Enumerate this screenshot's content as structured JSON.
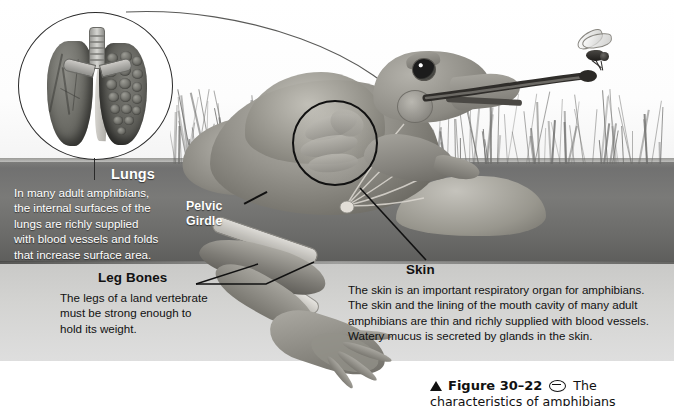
{
  "figure": {
    "background": {
      "sky_color": "#ffffff",
      "water_color": "#6f6f6f",
      "underwater_color": "#d3d3d1"
    }
  },
  "insets": {
    "lungs": {
      "label": "lungs-magnification-circle",
      "parts": [
        "trachea",
        "left-lung",
        "right-lung-cutaway",
        "alveoli"
      ]
    }
  },
  "callouts": [
    {
      "id": "lungs",
      "title": "Lungs",
      "body": "In many adult amphibians, the internal surfaces of the lungs are richly supplied with blood vessels and folds that increase surface area.",
      "lines": [
        "In many adult amphibians,",
        "the internal surfaces of the",
        "lungs are richly supplied",
        "with blood vessels and folds",
        "that increase surface area."
      ],
      "text_color": "#ffffff"
    },
    {
      "id": "pelvic-girdle",
      "title": "Pelvic Girdle",
      "lines": [
        "Pelvic",
        "Girdle"
      ],
      "body": "",
      "text_color": "#ffffff"
    },
    {
      "id": "leg-bones",
      "title": "Leg Bones",
      "body": "The legs of a land vertebrate must be strong enough to hold its weight.",
      "lines": [
        "The legs of a land vertebrate",
        "must be strong enough to",
        "hold its weight."
      ],
      "text_color": "#111111"
    },
    {
      "id": "skin",
      "title": "Skin",
      "body": "The skin is an important respiratory organ for amphibians. The skin and the lining of the mouth cavity of many adult amphibians are thin and richly supplied with blood vessels. Watery mucus is secreted by glands in the skin.",
      "lines": [
        "The skin is an important respiratory organ for amphibians.",
        "The skin and the lining of the mouth cavity of many adult",
        "amphibians are thin and richly supplied with blood vessels.",
        "Watery mucus is secreted by glands in the skin."
      ],
      "text_color": "#111111"
    }
  ],
  "caption": {
    "marker": "triangle-up-icon",
    "label": "Figure 30–22",
    "icon": "oval-link-icon",
    "text": "The",
    "line2": "characteristics of amphibians"
  },
  "scene_objects": [
    "frog",
    "extended-tongue",
    "fly",
    "grass",
    "rock",
    "water-surface",
    "pelvic-girdle-bones",
    "hind-leg-bones",
    "webbed-foot"
  ]
}
